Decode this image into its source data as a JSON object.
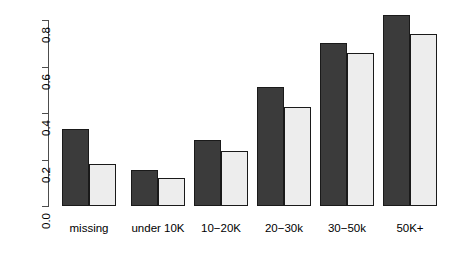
{
  "chart_data": {
    "type": "bar",
    "title": "",
    "subtitle": "",
    "xlabel": "",
    "ylabel": "",
    "categories": [
      "missing",
      "under 10K",
      "10−20K",
      "20−30k",
      "30−50k",
      "50K+"
    ],
    "series": [
      {
        "name": "dark",
        "color": "#3b3b3b",
        "values": [
          0.33,
          0.155,
          0.285,
          0.51,
          0.7,
          0.82
        ]
      },
      {
        "name": "light",
        "color": "#ededed",
        "values": [
          0.18,
          0.12,
          0.235,
          0.425,
          0.66,
          0.74
        ]
      }
    ],
    "ylim": [
      0.0,
      0.8
    ],
    "yticks": [
      "0.0",
      "0.2",
      "0.4",
      "0.6",
      "0.8"
    ],
    "ytick_values": [
      0.0,
      0.2,
      0.4,
      0.6,
      0.8
    ],
    "grid": false,
    "legend": "none",
    "axis_color": "#4d4d4d",
    "bar_border_color": "#1a1a1a",
    "background": "#ffffff"
  },
  "layout": {
    "baseline_y": 206,
    "top_y": 20,
    "bar_width": 27,
    "group_left": [
      62,
      131,
      194,
      257,
      320,
      383
    ],
    "group_gap": 9
  }
}
